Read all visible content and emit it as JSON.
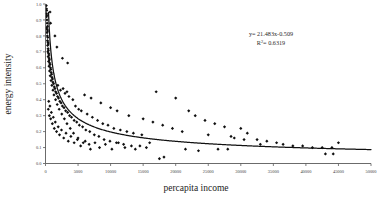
{
  "chart_data": {
    "type": "scatter",
    "title": "",
    "xlabel": "percapita income",
    "ylabel": "energy intensity",
    "xlim": [
      0,
      50000
    ],
    "ylim": [
      0,
      1.0
    ],
    "xticks": [
      0,
      5000,
      10000,
      15000,
      20000,
      25000,
      30000,
      35000,
      40000,
      45000,
      50000
    ],
    "xtick_labels": [
      "0",
      "5000",
      "10000",
      "15000",
      "20000",
      "25000",
      "30000",
      "35000",
      "40000",
      "45000",
      "50000"
    ],
    "yticks": [
      0.0,
      0.1,
      0.2,
      0.3,
      0.4,
      0.5,
      0.6,
      0.7,
      0.8,
      0.9,
      1.0
    ],
    "ytick_labels": [
      "0.0",
      "0.1",
      "0.2",
      "0.3",
      "0.4",
      "0.5",
      "0.6",
      "0.7",
      "0.8",
      "0.9",
      "1.0"
    ],
    "grid": false,
    "legend": false,
    "annotations": {
      "equation": "y= 21.483x-0.509",
      "equation_base": "y= 21.483x",
      "equation_exponent": "-0.509",
      "r_squared_label": "R",
      "r_squared_sup": "2",
      "r_squared_value": "= 0.6319"
    },
    "trendline": {
      "type": "power",
      "coefficient": 21.483,
      "exponent": -0.509,
      "r_squared": 0.6319
    },
    "marker": {
      "shape": "diamond",
      "color": "#101010",
      "size": 1.6
    },
    "points": [
      [
        120,
        0.99
      ],
      [
        150,
        0.97
      ],
      [
        180,
        0.96
      ],
      [
        140,
        0.94
      ],
      [
        200,
        0.93
      ],
      [
        160,
        0.92
      ],
      [
        220,
        0.9
      ],
      [
        700,
        0.95
      ],
      [
        250,
        0.88
      ],
      [
        300,
        0.86
      ],
      [
        190,
        0.85
      ],
      [
        260,
        0.84
      ],
      [
        320,
        0.83
      ],
      [
        240,
        0.82
      ],
      [
        780,
        0.88
      ],
      [
        280,
        0.8
      ],
      [
        350,
        0.79
      ],
      [
        300,
        0.77
      ],
      [
        380,
        0.76
      ],
      [
        420,
        0.75
      ],
      [
        330,
        0.74
      ],
      [
        1450,
        0.8
      ],
      [
        400,
        0.72
      ],
      [
        450,
        0.71
      ],
      [
        360,
        0.7
      ],
      [
        480,
        0.69
      ],
      [
        520,
        0.68
      ],
      [
        410,
        0.67
      ],
      [
        560,
        0.66
      ],
      [
        1750,
        0.73
      ],
      [
        600,
        0.65
      ],
      [
        470,
        0.64
      ],
      [
        640,
        0.63
      ],
      [
        700,
        0.62
      ],
      [
        540,
        0.61
      ],
      [
        760,
        0.6
      ],
      [
        820,
        0.59
      ],
      [
        620,
        0.58
      ],
      [
        880,
        0.57
      ],
      [
        2600,
        0.66
      ],
      [
        940,
        0.56
      ],
      [
        720,
        0.55
      ],
      [
        1000,
        0.54
      ],
      [
        1080,
        0.53
      ],
      [
        850,
        0.52
      ],
      [
        1150,
        0.51
      ],
      [
        1250,
        0.5
      ],
      [
        980,
        0.49
      ],
      [
        1350,
        0.48
      ],
      [
        3400,
        0.63
      ],
      [
        1450,
        0.47
      ],
      [
        1150,
        0.46
      ],
      [
        1550,
        0.45
      ],
      [
        1700,
        0.44
      ],
      [
        1300,
        0.43
      ],
      [
        1850,
        0.42
      ],
      [
        2000,
        0.41
      ],
      [
        1550,
        0.4
      ],
      [
        2200,
        0.39
      ],
      [
        2400,
        0.38
      ],
      [
        1800,
        0.37
      ],
      [
        2600,
        0.36
      ],
      [
        2850,
        0.35
      ],
      [
        2100,
        0.34
      ],
      [
        3100,
        0.33
      ],
      [
        3400,
        0.32
      ],
      [
        2500,
        0.31
      ],
      [
        3700,
        0.3
      ],
      [
        4000,
        0.29
      ],
      [
        2900,
        0.28
      ],
      [
        4400,
        0.27
      ],
      [
        4800,
        0.26
      ],
      [
        3300,
        0.25
      ],
      [
        5200,
        0.24
      ],
      [
        5700,
        0.23
      ],
      [
        3800,
        0.22
      ],
      [
        6200,
        0.21
      ],
      [
        6800,
        0.2
      ],
      [
        4300,
        0.19
      ],
      [
        7500,
        0.18
      ],
      [
        8200,
        0.17
      ],
      [
        5000,
        0.16
      ],
      [
        9000,
        0.15
      ],
      [
        9900,
        0.14
      ],
      [
        5800,
        0.13
      ],
      [
        10900,
        0.13
      ],
      [
        12000,
        0.12
      ],
      [
        6700,
        0.12
      ],
      [
        13200,
        0.11
      ],
      [
        14500,
        0.11
      ],
      [
        2300,
        0.46
      ],
      [
        3000,
        0.44
      ],
      [
        3600,
        0.42
      ],
      [
        4200,
        0.4
      ],
      [
        1900,
        0.49
      ],
      [
        2700,
        0.47
      ],
      [
        3300,
        0.45
      ],
      [
        5500,
        0.33
      ],
      [
        6400,
        0.31
      ],
      [
        7200,
        0.29
      ],
      [
        4600,
        0.36
      ],
      [
        5100,
        0.34
      ],
      [
        8000,
        0.27
      ],
      [
        8800,
        0.25
      ],
      [
        9600,
        0.24
      ],
      [
        10500,
        0.22
      ],
      [
        11500,
        0.21
      ],
      [
        12500,
        0.2
      ],
      [
        13500,
        0.19
      ],
      [
        14800,
        0.18
      ],
      [
        6000,
        0.43
      ],
      [
        7000,
        0.41
      ],
      [
        8500,
        0.38
      ],
      [
        10000,
        0.35
      ],
      [
        11000,
        0.33
      ],
      [
        12800,
        0.3
      ],
      [
        15000,
        0.28
      ],
      [
        16500,
        0.26
      ],
      [
        18000,
        0.24
      ],
      [
        19500,
        0.22
      ],
      [
        17000,
        0.45
      ],
      [
        20000,
        0.41
      ],
      [
        22000,
        0.33
      ],
      [
        23000,
        0.3
      ],
      [
        24500,
        0.27
      ],
      [
        26000,
        0.25
      ],
      [
        27500,
        0.23
      ],
      [
        21000,
        0.2
      ],
      [
        25000,
        0.18
      ],
      [
        28500,
        0.17
      ],
      [
        30000,
        0.22
      ],
      [
        31000,
        0.19
      ],
      [
        29000,
        0.16
      ],
      [
        32500,
        0.15
      ],
      [
        34000,
        0.14
      ],
      [
        35500,
        0.13
      ],
      [
        33000,
        0.12
      ],
      [
        36500,
        0.12
      ],
      [
        38000,
        0.11
      ],
      [
        39500,
        0.11
      ],
      [
        41000,
        0.1
      ],
      [
        42500,
        0.1
      ],
      [
        44000,
        0.1
      ],
      [
        45000,
        0.13
      ],
      [
        43000,
        0.06
      ],
      [
        44200,
        0.06
      ],
      [
        17500,
        0.03
      ],
      [
        18200,
        0.04
      ],
      [
        21500,
        0.09
      ],
      [
        23500,
        0.08
      ],
      [
        26500,
        0.09
      ],
      [
        28000,
        0.09
      ],
      [
        30500,
        0.15
      ],
      [
        15500,
        0.1
      ],
      [
        16000,
        0.13
      ],
      [
        13800,
        0.09
      ],
      [
        12200,
        0.1
      ],
      [
        11200,
        0.13
      ],
      [
        10200,
        0.09
      ],
      [
        9200,
        0.12
      ],
      [
        8300,
        0.1
      ],
      [
        7600,
        0.13
      ],
      [
        6900,
        0.09
      ],
      [
        6100,
        0.14
      ],
      [
        5400,
        0.11
      ],
      [
        4900,
        0.15
      ],
      [
        4400,
        0.13
      ],
      [
        3900,
        0.17
      ],
      [
        3500,
        0.14
      ],
      [
        3150,
        0.19
      ],
      [
        2800,
        0.16
      ],
      [
        2450,
        0.21
      ],
      [
        2150,
        0.18
      ],
      [
        1950,
        0.23
      ],
      [
        1700,
        0.2
      ],
      [
        1500,
        0.26
      ],
      [
        1350,
        0.22
      ],
      [
        1200,
        0.29
      ],
      [
        1050,
        0.25
      ],
      [
        900,
        0.32
      ],
      [
        800,
        0.28
      ],
      [
        680,
        0.36
      ],
      [
        590,
        0.3
      ],
      [
        500,
        0.39
      ],
      [
        430,
        0.34
      ]
    ]
  }
}
